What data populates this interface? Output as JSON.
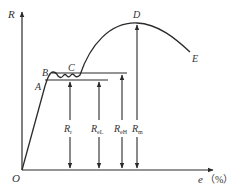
{
  "diagram": {
    "type": "stress-strain curve",
    "y_axis": {
      "label": "R"
    },
    "x_axis": {
      "label": "e",
      "unit": "（%）"
    },
    "origin": "O",
    "points": {
      "A": "A",
      "B": "B",
      "C": "C",
      "D": "D",
      "E": "E"
    },
    "measures": [
      {
        "symbol": "R",
        "subscript": "r"
      },
      {
        "symbol": "R",
        "subscript": "eL"
      },
      {
        "symbol": "R",
        "subscript": "eH"
      },
      {
        "symbol": "R",
        "subscript": "m"
      }
    ],
    "colors": {
      "line": "#2a2a2a",
      "text": "#333333",
      "background": "#ffffff"
    }
  }
}
